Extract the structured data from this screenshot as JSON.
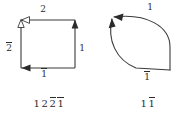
{
  "figure": {
    "panels": [
      {
        "id": "square",
        "name": "square-polygon-diagram",
        "shape": "square",
        "edge_labels": {
          "top": {
            "text": "2",
            "overbar": false
          },
          "left": {
            "text": "2",
            "overbar": true
          },
          "right": {
            "text": "1",
            "overbar": false
          },
          "bottom": {
            "text": "1",
            "overbar": true
          }
        },
        "arrow_markers": [
          {
            "edge": "top",
            "direction": "left",
            "style": "open"
          },
          {
            "edge": "right",
            "direction": "up",
            "style": "solid"
          },
          {
            "edge": "bottom",
            "direction": "left",
            "style": "solid"
          }
        ],
        "caption_glyphs": [
          {
            "text": "1",
            "overbar": false
          },
          {
            "text": "2",
            "overbar": false
          },
          {
            "text": "2",
            "overbar": true
          },
          {
            "text": "1",
            "overbar": true
          }
        ],
        "caption_plain": "1 2 2̅ 1̅"
      },
      {
        "id": "bigon",
        "name": "bigon-lens-diagram",
        "shape": "bigon",
        "edge_labels": {
          "top": {
            "text": "1",
            "overbar": false
          },
          "bottom": {
            "text": "1",
            "overbar": true
          }
        },
        "arrow_markers": [
          {
            "edge": "top",
            "direction": "left",
            "style": "solid"
          },
          {
            "edge": "bottom-left-curve",
            "direction": "up",
            "style": "solid"
          }
        ],
        "caption_glyphs": [
          {
            "text": "1",
            "overbar": false
          },
          {
            "text": "1",
            "overbar": true
          }
        ],
        "caption_plain": "1 1̅"
      }
    ],
    "colors": {
      "stroke": "#3a3a3a",
      "text": "#2b2b2b",
      "background": "#ffffff"
    }
  }
}
